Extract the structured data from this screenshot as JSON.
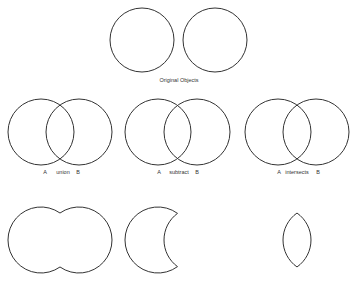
{
  "title": "Original Objects",
  "stroke_color": "#333333",
  "operations": [
    {
      "a_label": "A",
      "op_label": "union",
      "b_label": "B"
    },
    {
      "a_label": "A",
      "op_label": "subtract",
      "b_label": "B"
    },
    {
      "a_label": "A",
      "op_label": "intersects",
      "b_label": "B"
    }
  ]
}
